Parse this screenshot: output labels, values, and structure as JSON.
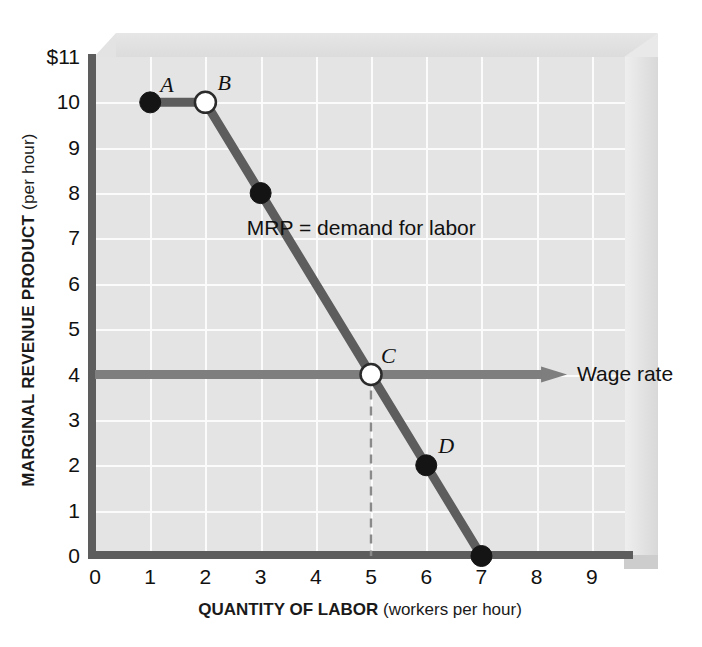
{
  "chart_data": {
    "type": "line",
    "title": "",
    "xlabel": "QUANTITY OF LABOR",
    "xlabel_paren": "(workers per hour)",
    "ylabel": "MARGINAL REVENUE PRODUCT",
    "ylabel_paren": "(per hour)",
    "xlim": [
      0,
      9.6
    ],
    "ylim": [
      0,
      11
    ],
    "grid": true,
    "legend_position": "inline-annotation",
    "xticks": [
      "0",
      "1",
      "2",
      "3",
      "4",
      "5",
      "6",
      "7",
      "8",
      "9"
    ],
    "yticks": [
      "$11",
      "10",
      "9",
      "8",
      "7",
      "6",
      "5",
      "4",
      "3",
      "2",
      "1",
      "0"
    ],
    "series": [
      {
        "name": "MRP = demand for labor",
        "color": "#5d5d5d",
        "x": [
          1,
          2,
          3,
          5,
          6,
          7
        ],
        "values": [
          10,
          10,
          8,
          4,
          2,
          0
        ]
      },
      {
        "name": "Wage rate",
        "color": "#7e7e7e",
        "type": "horizontal-line",
        "y": 4,
        "x_start": 0,
        "x_end": 8.55,
        "arrow": "right"
      }
    ],
    "points": [
      {
        "label": "A",
        "x": 1,
        "y": 10,
        "fill": "solid",
        "label_dx": 10,
        "label_dy": -30
      },
      {
        "label": "B",
        "x": 2,
        "y": 10,
        "fill": "hollow",
        "label_dx": 12,
        "label_dy": -32
      },
      {
        "label": "",
        "x": 3,
        "y": 8,
        "fill": "solid",
        "label_dx": 0,
        "label_dy": 0
      },
      {
        "label": "C",
        "x": 5,
        "y": 4,
        "fill": "hollow",
        "label_dx": 10,
        "label_dy": -32
      },
      {
        "label": "D",
        "x": 6,
        "y": 2,
        "fill": "solid",
        "label_dx": 12,
        "label_dy": -32
      },
      {
        "label": "",
        "x": 7,
        "y": 0,
        "fill": "solid",
        "label_dx": 0,
        "label_dy": 0
      }
    ],
    "annotations": [
      {
        "name": "mrp-label",
        "text": "MRP = demand for labor"
      },
      {
        "name": "wage-label",
        "text": "Wage rate"
      }
    ],
    "dropline": {
      "from_x": 5,
      "from_y": 4,
      "to_y": 0,
      "style": "dashed"
    }
  },
  "colors": {
    "plot_background": "#e4e4e4",
    "grid": "#fbfbfb",
    "axis": "#5d5d5d",
    "curve": "#5d5d5d",
    "wage_line": "#7e7e7e",
    "point_fill_solid": "#141414",
    "point_fill_hollow": "#ffffff",
    "frame_3d": "#e3e3e3"
  }
}
